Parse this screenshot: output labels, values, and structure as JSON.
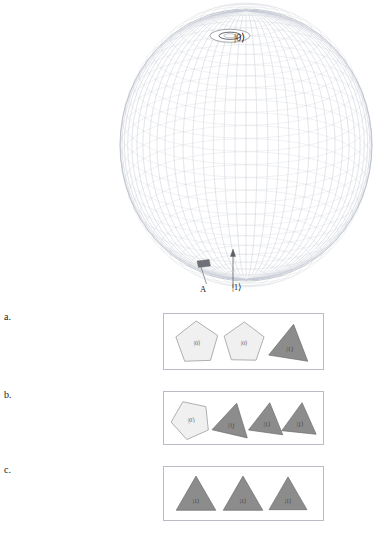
{
  "figure": {
    "sphere": {
      "kind": "bloch-sphere-wireframe",
      "pole_label_top": "|0⟩",
      "pole_label_bottom": "|1⟩",
      "marker_label": "A",
      "mesh_color": "#c9cdd6",
      "outline_color": "#aeb3bd",
      "cap_fill": "#ffffff",
      "marker_fill": "#6f7178",
      "center_x": 246,
      "center_y": 145,
      "radius_x": 126,
      "radius_y": 136,
      "n_parallels": 34,
      "n_meridians": 36
    },
    "annotations": {
      "arrow_label": "|1⟩",
      "leader_label": "A",
      "arrow_color": "#5c5f66",
      "leader_color": "#6c6f76"
    }
  },
  "rows": [
    {
      "letter": "a.",
      "panel_border": "#b9bcc4",
      "shapes": [
        {
          "type": "pentagon",
          "label": "|0⟩",
          "fill": "#f0f0f0",
          "stroke": "#8d9097",
          "rotation": -2,
          "cx": 33,
          "cy": 29,
          "r": 22
        },
        {
          "type": "pentagon",
          "label": "|0⟩",
          "fill": "#f0f0f0",
          "stroke": "#8d9097",
          "rotation": 1,
          "cx": 80,
          "cy": 29,
          "r": 21
        },
        {
          "type": "triangle",
          "label": "|1⟩",
          "fill": "#8c8c8c",
          "stroke": "#6d6d6d",
          "rotation": 9,
          "cx": 126,
          "cy": 30,
          "r": 24
        }
      ]
    },
    {
      "letter": "b.",
      "panel_border": "#b9bcc4",
      "shapes": [
        {
          "type": "pentagon",
          "label": "|0⟩",
          "fill": "#f0f0f0",
          "stroke": "#8d9097",
          "rotation": -24,
          "cx": 27,
          "cy": 28,
          "r": 20
        },
        {
          "type": "triangle",
          "label": "|1⟩",
          "fill": "#8c8c8c",
          "stroke": "#6d6d6d",
          "rotation": 13,
          "cx": 68,
          "cy": 29,
          "r": 22
        },
        {
          "type": "triangle",
          "label": "|1⟩",
          "fill": "#8c8c8c",
          "stroke": "#6d6d6d",
          "rotation": 8,
          "cx": 103,
          "cy": 28,
          "r": 21
        },
        {
          "type": "triangle",
          "label": "|1⟩",
          "fill": "#8c8c8c",
          "stroke": "#6d6d6d",
          "rotation": 6,
          "cx": 136,
          "cy": 28,
          "r": 21
        }
      ]
    },
    {
      "letter": "c.",
      "panel_border": "#b9bcc4",
      "shapes": [
        {
          "type": "triangle",
          "label": "|1⟩",
          "fill": "#8c8c8c",
          "stroke": "#6d6d6d",
          "rotation": 0,
          "cx": 32,
          "cy": 29,
          "r": 24
        },
        {
          "type": "triangle",
          "label": "|1⟩",
          "fill": "#8c8c8c",
          "stroke": "#6d6d6d",
          "rotation": 0,
          "cx": 79,
          "cy": 29,
          "r": 24
        },
        {
          "type": "triangle",
          "label": "|1⟩",
          "fill": "#8c8c8c",
          "stroke": "#6d6d6d",
          "rotation": 0,
          "cx": 124,
          "cy": 29,
          "r": 23
        }
      ]
    }
  ]
}
